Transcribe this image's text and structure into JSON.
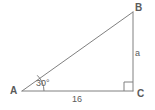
{
  "figure": {
    "type": "geometry-diagram",
    "shape": "right-triangle",
    "background_color": "#ffffff",
    "stroke_color": "#808080",
    "text_color": "#5a5a5a"
  },
  "vertices": {
    "A": {
      "label": "A",
      "x": 22,
      "y": 91
    },
    "B": {
      "label": "B",
      "x": 133,
      "y": 12
    },
    "C": {
      "label": "C",
      "x": 133,
      "y": 91
    }
  },
  "angles": {
    "at_A": {
      "label": "30°",
      "value": 30,
      "unit": "degrees",
      "marker": "arc"
    },
    "at_C": {
      "label": "",
      "value": 90,
      "unit": "degrees",
      "marker": "right-angle-square"
    }
  },
  "sides": {
    "BC": {
      "label": "a",
      "description": "vertical leg opposite angle A"
    },
    "AC": {
      "label": "16",
      "description": "horizontal leg adjacent to angle A"
    },
    "AB": {
      "label": "",
      "description": "hypotenuse"
    }
  }
}
